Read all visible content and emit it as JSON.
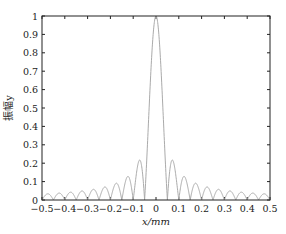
{
  "chart_data": {
    "type": "line",
    "title": "",
    "xlabel": "x/mm",
    "ylabel": "振幅y",
    "xlim": [
      -0.5,
      0.5
    ],
    "ylim": [
      0,
      1
    ],
    "grid": false,
    "legend": null,
    "x_ticks": [
      "−0.5",
      "−0.4",
      "−0.3",
      "−0.2",
      "−0.1",
      "0",
      "0.1",
      "0.2",
      "0.3",
      "0.4",
      "0.5"
    ],
    "y_ticks": [
      "0",
      "0.1",
      "0.2",
      "0.3",
      "0.4",
      "0.5",
      "0.6",
      "0.7",
      "0.8",
      "0.9",
      "1"
    ],
    "series": [
      {
        "name": "amplitude",
        "color": "#aaaaaa",
        "description": "sinc-like diffraction amplitude |sin(πx/0.05)/(πx/0.05)|, main peak 1 at x=0, side lobes ~0.21, 0.13, 0.09, ...",
        "x": [
          -0.5,
          -0.475,
          -0.45,
          -0.425,
          -0.4,
          -0.375,
          -0.35,
          -0.325,
          -0.3,
          -0.275,
          -0.25,
          -0.225,
          -0.2,
          -0.175,
          -0.15,
          -0.125,
          -0.1,
          -0.075,
          -0.05,
          -0.025,
          0,
          0.025,
          0.05,
          0.075,
          0.1,
          0.125,
          0.15,
          0.175,
          0.2,
          0.225,
          0.25,
          0.275,
          0.3,
          0.325,
          0.35,
          0.375,
          0.4,
          0.425,
          0.45,
          0.475,
          0.5
        ],
        "y": [
          0,
          0.033,
          0,
          0.037,
          0,
          0.042,
          0,
          0.049,
          0,
          0.058,
          0,
          0.071,
          0,
          0.091,
          0,
          0.127,
          0,
          0.212,
          0,
          0.637,
          1,
          0.637,
          0,
          0.212,
          0,
          0.127,
          0,
          0.091,
          0,
          0.071,
          0,
          0.058,
          0,
          0.049,
          0,
          0.042,
          0,
          0.037,
          0,
          0.033,
          0
        ]
      }
    ]
  },
  "plot": {
    "box": {
      "left": 42,
      "top": 16,
      "right": 270,
      "bottom": 200
    },
    "lobe_width": 0.05
  }
}
